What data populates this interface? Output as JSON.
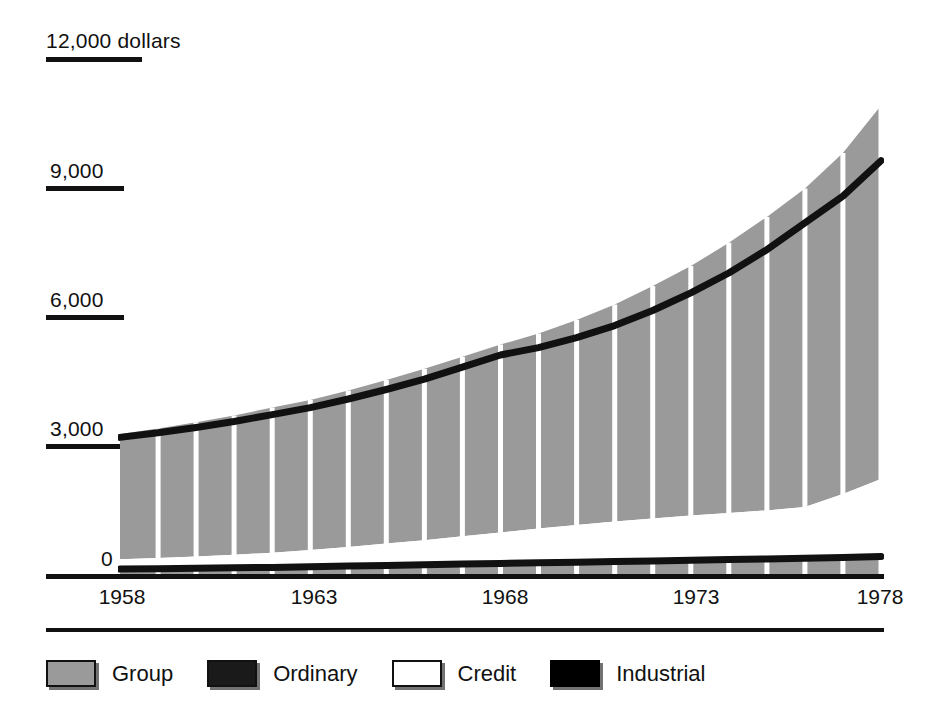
{
  "chart_data": {
    "type": "area",
    "title": "",
    "subtitle": "",
    "xlabel": "",
    "ylabel": "12,000 dollars",
    "unit_note": "dollars",
    "grid": false,
    "legend_position": "bottom-left",
    "stacked": true,
    "xlim": [
      1958,
      1978
    ],
    "ylim": [
      0,
      12000
    ],
    "y_ticks": [
      {
        "value": 12000,
        "label": "12,000 dollars"
      },
      {
        "value": 9000,
        "label": "9,000"
      },
      {
        "value": 6000,
        "label": "6,000"
      },
      {
        "value": 3000,
        "label": "3,000"
      },
      {
        "value": 0,
        "label": "0"
      }
    ],
    "x_ticks": [
      {
        "value": 1958,
        "label": "1958"
      },
      {
        "value": 1963,
        "label": "1963"
      },
      {
        "value": 1968,
        "label": "1968"
      },
      {
        "value": 1973,
        "label": "1973"
      },
      {
        "value": 1978,
        "label": "1978"
      }
    ],
    "x": [
      1958,
      1959,
      1960,
      1961,
      1962,
      1963,
      1964,
      1965,
      1966,
      1967,
      1968,
      1969,
      1970,
      1971,
      1972,
      1973,
      1974,
      1975,
      1976,
      1977,
      1978
    ],
    "series": [
      {
        "name": "Group",
        "color": "#9a9a9a",
        "values": [
          3290,
          3420,
          3560,
          3720,
          3900,
          4080,
          4300,
          4540,
          4800,
          5080,
          5360,
          5620,
          5930,
          6290,
          6720,
          7180,
          7720,
          8320,
          8980,
          9800,
          10900
        ]
      },
      {
        "name": "Ordinary",
        "color": "#1a1a1a",
        "values": [
          3210,
          3320,
          3440,
          3580,
          3740,
          3900,
          4100,
          4320,
          4560,
          4840,
          5120,
          5290,
          5520,
          5800,
          6150,
          6560,
          7020,
          7560,
          8180,
          8800,
          9620
        ]
      },
      {
        "name": "Credit",
        "color": "#ffffff",
        "values": [
          390,
          420,
          450,
          490,
          540,
          600,
          670,
          750,
          830,
          920,
          1010,
          1100,
          1180,
          1260,
          1330,
          1400,
          1460,
          1520,
          1600,
          1900,
          2250
        ]
      },
      {
        "name": "Industrial",
        "color": "#000000",
        "values": [
          160,
          170,
          180,
          190,
          200,
          215,
          230,
          245,
          260,
          275,
          290,
          305,
          320,
          335,
          350,
          365,
          380,
          395,
          410,
          430,
          450
        ]
      }
    ]
  },
  "axis": {
    "baseline_label": "0",
    "top_label": "12,000 dollars"
  },
  "legend": {
    "items": [
      {
        "label": "Group",
        "swatch": "gray-filled-swatch",
        "color": "#9a9a9a"
      },
      {
        "label": "Ordinary",
        "swatch": "dark-filled-swatch",
        "color": "#1a1a1a"
      },
      {
        "label": "Credit",
        "swatch": "white-outlined-swatch",
        "color": "#ffffff"
      },
      {
        "label": "Industrial",
        "swatch": "black-filled-swatch",
        "color": "#000000"
      }
    ]
  }
}
